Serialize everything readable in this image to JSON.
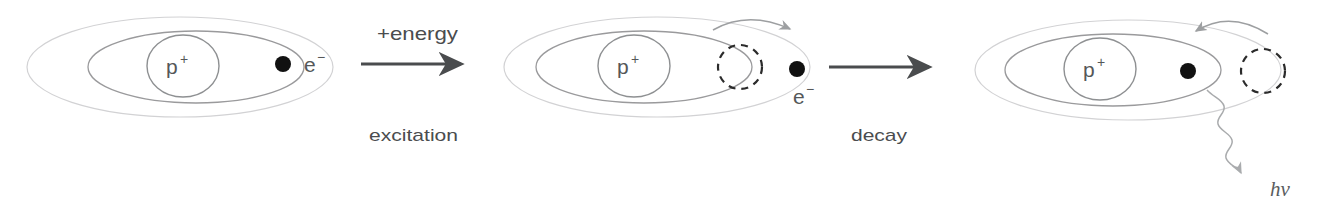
{
  "figure": {
    "background_color": "#ffffff"
  },
  "labels": {
    "proton": "p",
    "proton_charge": "+",
    "electron": "e",
    "electron_charge": "−",
    "energy_in": "+energy",
    "step_excitation": "excitation",
    "step_decay": "decay",
    "photon": "hν"
  },
  "stages": [
    {
      "name": "ground-state-atom",
      "order": 1,
      "electron_orbit": "inner",
      "has_ghost_electron": false,
      "has_curved_arrow": false,
      "electron_label_position": "right",
      "emits_photon": false
    },
    {
      "name": "excited-state-atom",
      "order": 2,
      "electron_orbit": "outer",
      "has_ghost_electron": true,
      "ghost_position": "inner-orbit-right",
      "has_curved_arrow": true,
      "curved_arrow_direction": "outward-right",
      "electron_label_position": "below",
      "emits_photon": false
    },
    {
      "name": "decayed-state-atom",
      "order": 3,
      "electron_orbit": "inner",
      "has_ghost_electron": true,
      "ghost_position": "outer-orbit-right",
      "has_curved_arrow": true,
      "curved_arrow_direction": "inward-left",
      "electron_label_position": "none",
      "emits_photon": true
    }
  ],
  "transitions": [
    {
      "name": "excitation-transition",
      "above_label": "+energy",
      "below_label": "excitation",
      "direction": "right"
    },
    {
      "name": "decay-transition",
      "above_label": "",
      "below_label": "decay",
      "direction": "right"
    }
  ],
  "colors": {
    "outer_orbit": "#d2d2d4",
    "inner_orbit": "#9a9a9c",
    "nucleus_stroke": "#8e9092",
    "electron_fill": "#111111",
    "ghost_stroke": "#2b2b2b",
    "arrow": "#4a4c4e",
    "curve_arrow": "#9d9fa1",
    "text": "#555759"
  }
}
